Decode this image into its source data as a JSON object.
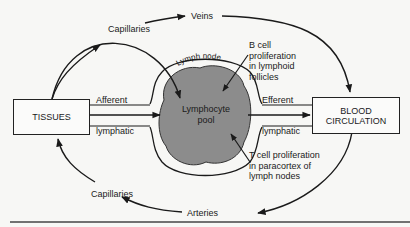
{
  "diagram": {
    "nodes": {
      "tissues": "TISSUES",
      "blood_1": "BLOOD",
      "blood_2": "CIRCULATION",
      "pool_1": "Lymphocyte",
      "pool_2": "pool",
      "lymph_node": "Lymph node"
    },
    "labels": {
      "capillaries_top": "Capillaries",
      "veins": "Veins",
      "capillaries_bottom": "Capillaries",
      "arteries": "Arteries",
      "afferent": "Afferent",
      "lymphatic_left": "lymphatic",
      "efferent": "Efferent",
      "lymphatic_right": "lymphatic"
    },
    "annotations": {
      "b_cell": [
        "B cell",
        "proliferation",
        "in lymphoid",
        "follicles"
      ],
      "t_cell": [
        "T cell proliferation",
        "in paracortex of",
        "lymph nodes"
      ]
    },
    "colors": {
      "pool_fill": "#8c8c8c",
      "line": "#1a1a1a",
      "background": "#f7f7f5"
    }
  }
}
